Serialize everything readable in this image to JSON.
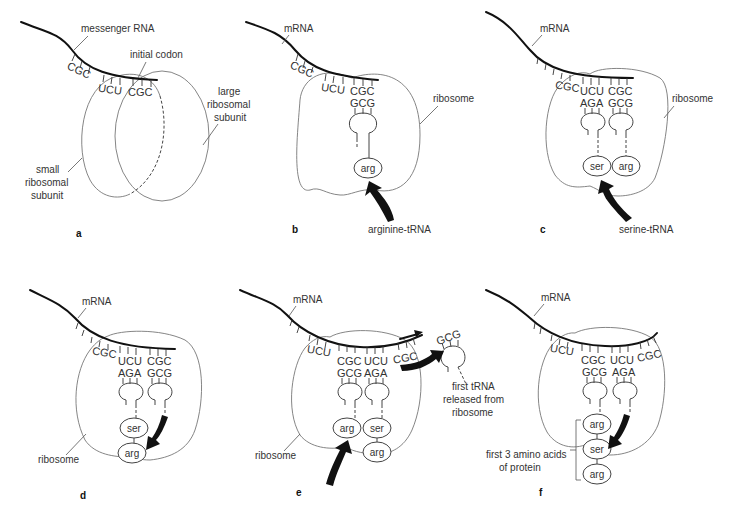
{
  "figure": {
    "panels": {
      "a": {
        "letter": "a",
        "labels": {
          "mrna": "messenger RNA",
          "initial_codon": "initial codon",
          "large_subunit": [
            "large",
            "ribosomal",
            "subunit"
          ],
          "small_subunit": [
            "small",
            "ribosomal",
            "subunit"
          ]
        },
        "codons": [
          "CGC",
          "UCU",
          "CGC"
        ]
      },
      "b": {
        "letter": "b",
        "labels": {
          "mrna": "mRNA",
          "ribosome": "ribosome",
          "incoming": "arginine-tRNA"
        },
        "codons": [
          "CGC",
          "UCU",
          "CGC"
        ],
        "anticodons": [
          "GCG"
        ],
        "amino_acids": [
          "arg"
        ]
      },
      "c": {
        "letter": "c",
        "labels": {
          "mrna": "mRNA",
          "ribosome": "ribosome",
          "incoming": "serine-tRNA"
        },
        "codons": [
          "CGC",
          "UCU",
          "CGC"
        ],
        "anticodons": [
          "AGA",
          "GCG"
        ],
        "amino_acids": [
          "ser",
          "arg"
        ]
      },
      "d": {
        "letter": "d",
        "labels": {
          "mrna": "mRNA",
          "ribosome": "ribosome"
        },
        "codons": [
          "CGC",
          "UCU",
          "CGC"
        ],
        "anticodons": [
          "AGA",
          "GCG"
        ],
        "amino_acids": [
          "ser",
          "arg"
        ]
      },
      "e": {
        "letter": "e",
        "labels": {
          "mrna": "mRNA",
          "ribosome": "ribosome",
          "released": [
            "first tRNA",
            "released from",
            "ribosome"
          ]
        },
        "codons": [
          "UCU",
          "CGC",
          "UCU",
          "CGC"
        ],
        "anticodons": [
          "GCG",
          "AGA"
        ],
        "released_anticodon": "GCG",
        "amino_acids": [
          "arg",
          "ser",
          "arg"
        ]
      },
      "f": {
        "letter": "f",
        "labels": {
          "mrna": "mRNA",
          "protein": [
            "first 3 amino acids",
            "of protein"
          ]
        },
        "codons": [
          "UCU",
          "CGC",
          "UCU",
          "CGC"
        ],
        "anticodons": [
          "GCG",
          "AGA"
        ],
        "amino_acids": [
          "arg",
          "ser",
          "arg"
        ]
      }
    }
  }
}
